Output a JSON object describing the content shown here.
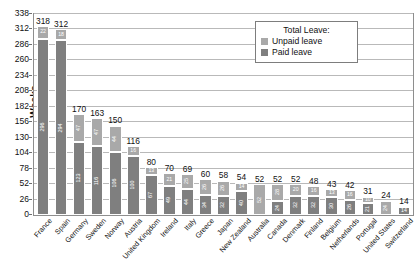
{
  "chart_data": {
    "type": "bar",
    "title": "",
    "xlabel": "",
    "ylabel": "Weeks",
    "ylim": [
      0,
      338
    ],
    "yticks": [
      0,
      26,
      52,
      78,
      104,
      130,
      156,
      182,
      208,
      234,
      260,
      286,
      312,
      338
    ],
    "grid": true,
    "stacked": true,
    "legend_position": "top-right",
    "legend_title": "Total Leave:",
    "categories": [
      "France",
      "Spain",
      "Germany",
      "Sweden",
      "Norway",
      "Austria",
      "United Kingdom",
      "Ireland",
      "Italy",
      "Greece",
      "Japan",
      "New Zealand",
      "Australia",
      "Canada",
      "Denmark",
      "Finland",
      "Belgium",
      "Netherlands",
      "Portugal",
      "United States",
      "Switzerland"
    ],
    "series": [
      {
        "name": "Paid leave",
        "color": "#7f7f7f",
        "values": [
          296,
          294,
          123,
          116,
          106,
          100,
          67,
          49,
          44,
          34,
          32,
          40,
          0,
          24,
          32,
          32,
          30,
          26,
          21,
          0,
          14
        ]
      },
      {
        "name": "Unpaid leave",
        "color": "#a9a9a9",
        "values": [
          22,
          18,
          47,
          47,
          44,
          16,
          13,
          21,
          25,
          26,
          26,
          14,
          52,
          28,
          20,
          16,
          13,
          16,
          10,
          24,
          0
        ]
      }
    ],
    "totals": [
      318,
      312,
      170,
      163,
      150,
      116,
      80,
      70,
      69,
      60,
      58,
      54,
      52,
      52,
      52,
      48,
      43,
      42,
      31,
      24,
      14
    ]
  },
  "legend": {
    "title": "Total Leave:",
    "items": [
      {
        "label": "Unpaid leave",
        "swatch": "unpaid"
      },
      {
        "label": "Paid leave",
        "swatch": "paid"
      }
    ]
  },
  "axis": {
    "y_title": "Weeks"
  }
}
